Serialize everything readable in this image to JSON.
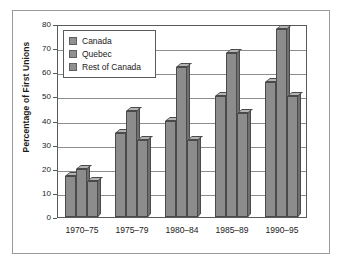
{
  "figure": {
    "frame_color": "#9a9a9a",
    "background": "#ffffff"
  },
  "chart_data": {
    "type": "bar",
    "title": "",
    "subtitle": "",
    "xlabel": "",
    "ylabel": "Percentage of First Unions",
    "ylim": [
      0,
      80
    ],
    "ytick_labels": [
      "80",
      "70",
      "60",
      "50",
      "40",
      "30",
      "20",
      "10",
      "0"
    ],
    "ytick_values": [
      80,
      70,
      60,
      50,
      40,
      30,
      20,
      10,
      0
    ],
    "grid": "horizontal",
    "legend_position": "upper-left-inside",
    "categories": [
      "1970–75",
      "1975–79",
      "1980–84",
      "1985–89",
      "1990–95"
    ],
    "series": [
      {
        "name": "Canada",
        "color": "#8c8c8c",
        "values": [
          17,
          35,
          40,
          50,
          56
        ]
      },
      {
        "name": "Quebec",
        "color": "#8c8c8c",
        "values": [
          20,
          44,
          62,
          68,
          78
        ]
      },
      {
        "name": "Rest of Canada",
        "color": "#8c8c8c",
        "values": [
          15,
          32,
          32,
          43,
          50
        ]
      }
    ],
    "annotations": []
  },
  "legend": {
    "items": [
      {
        "label": "Canada",
        "swatch_color": "#909090"
      },
      {
        "label": "Quebec",
        "swatch_color": "#909090"
      },
      {
        "label": "Rest of Canada",
        "swatch_color": "#909090"
      }
    ]
  },
  "axes": {
    "axis_line_color": "#5a5a5a",
    "gridline_color": "#8d8d8d"
  }
}
